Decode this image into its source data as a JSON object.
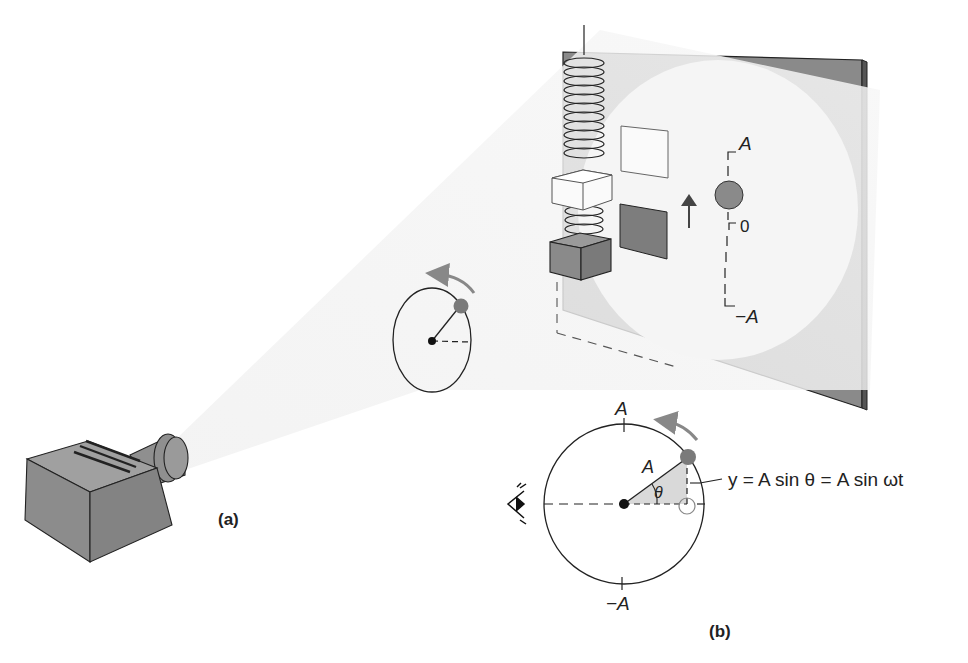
{
  "figure": {
    "panel_a_label": "(a)",
    "panel_b_label": "(b)"
  },
  "screen": {
    "label_top": "A",
    "label_zero": "0",
    "label_bottom": "−A"
  },
  "circle_b": {
    "label_top": "A",
    "label_bottom": "−A",
    "radius_label": "A",
    "angle_label": "θ",
    "equation": "y = A sin θ = A sin ωt"
  },
  "colors": {
    "gray_fill": "#8c8c8c",
    "screen_gray": "#8a8a8a",
    "light_beam": "#f2f2f2",
    "ball": "#7a7a7a",
    "line": "#222222",
    "arrow": "#888888"
  },
  "icons": [
    "eye-icon",
    "projector",
    "spring",
    "mass-block",
    "rotation-arrow"
  ]
}
